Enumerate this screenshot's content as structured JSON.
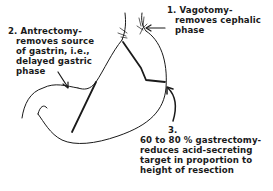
{
  "figure": {
    "stroke_color": "#1a1a1a",
    "background": "#ffffff"
  },
  "annotations": [
    {
      "number": "1.",
      "lines": [
        "Vagotomy-",
        "removes cephalic",
        "phase"
      ]
    },
    {
      "number": "2.",
      "lines": [
        "Antrectomy-",
        "removes source",
        "of gastrin, i.e.,",
        "delayed gastric",
        "phase"
      ]
    },
    {
      "number": "3.",
      "lines": [
        "60 to 80 % gastrectomy-",
        "reduces acid-secreting",
        "target in proportion to",
        "height of resection"
      ]
    }
  ]
}
